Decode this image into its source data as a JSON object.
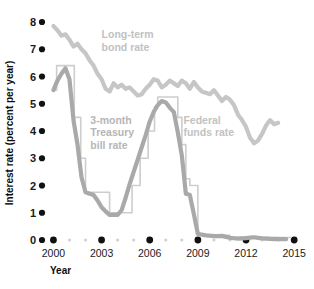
{
  "chart_data": {
    "type": "line",
    "title": "",
    "xlabel": "Year",
    "ylabel": "Interest rate (percent per year)",
    "xlim": [
      1999.6,
      2015.3
    ],
    "ylim": [
      0,
      8.4
    ],
    "grid": false,
    "legend_position": "inline-annotations",
    "x_ticks_major": [
      "2000",
      "2003",
      "2006",
      "2009",
      "2012",
      "2015"
    ],
    "x_ticks_major_values": [
      2000,
      2003,
      2006,
      2009,
      2012,
      2015
    ],
    "x_ticks_minor_values": [
      2001,
      2002,
      2004,
      2005,
      2007,
      2008,
      2010,
      2011,
      2013,
      2014
    ],
    "y_ticks": [
      "0",
      "1",
      "2",
      "3",
      "4",
      "5",
      "6",
      "7",
      "8"
    ],
    "y_tick_values": [
      0,
      1,
      2,
      3,
      4,
      5,
      6,
      7,
      8
    ],
    "series": [
      {
        "name": "Long-term bond rate",
        "color": "#c6c6c6",
        "label_color": "#c2c2c2",
        "style": "smooth-line",
        "label_x": 2003.0,
        "label_y": 7.25,
        "x": [
          2000.0,
          2000.25,
          2000.5,
          2000.75,
          2001.0,
          2001.25,
          2001.5,
          2001.75,
          2002.0,
          2002.25,
          2002.5,
          2002.75,
          2003.0,
          2003.25,
          2003.5,
          2003.75,
          2004.0,
          2004.25,
          2004.5,
          2004.75,
          2005.0,
          2005.25,
          2005.5,
          2005.75,
          2006.0,
          2006.25,
          2006.5,
          2006.75,
          2007.0,
          2007.25,
          2007.5,
          2007.75,
          2008.0,
          2008.25,
          2008.5,
          2008.75,
          2009.0,
          2009.25,
          2009.5,
          2009.75,
          2010.0,
          2010.25,
          2010.5,
          2010.75,
          2011.0,
          2011.25,
          2011.5,
          2011.75,
          2012.0,
          2012.25,
          2012.5,
          2012.75,
          2013.0,
          2013.25,
          2013.5,
          2013.75,
          2014.0
        ],
        "values": [
          7.85,
          7.7,
          7.5,
          7.55,
          7.35,
          7.1,
          7.2,
          7.0,
          6.85,
          6.6,
          6.4,
          6.1,
          5.9,
          5.55,
          5.45,
          5.75,
          5.6,
          5.7,
          5.55,
          5.6,
          5.45,
          5.3,
          5.35,
          5.55,
          5.7,
          5.9,
          5.85,
          5.6,
          5.7,
          5.85,
          5.75,
          5.65,
          5.85,
          5.75,
          5.55,
          5.8,
          5.6,
          5.45,
          5.4,
          5.35,
          5.5,
          5.3,
          5.1,
          5.25,
          5.15,
          4.95,
          4.6,
          4.4,
          4.15,
          3.75,
          3.55,
          3.65,
          3.9,
          4.2,
          4.4,
          4.25,
          4.3
        ]
      },
      {
        "name": "3-month Treasury bill rate",
        "color": "#a9a9a9",
        "label_color": "#b4b4b4",
        "style": "smooth-line",
        "label_x": 2002.3,
        "label_y": 4.0,
        "x": [
          2000.0,
          2000.25,
          2000.5,
          2000.75,
          2001.0,
          2001.25,
          2001.5,
          2001.75,
          2002.0,
          2002.25,
          2002.5,
          2002.75,
          2003.0,
          2003.25,
          2003.5,
          2003.75,
          2004.0,
          2004.25,
          2004.5,
          2004.75,
          2005.0,
          2005.25,
          2005.5,
          2005.75,
          2006.0,
          2006.25,
          2006.5,
          2006.75,
          2007.0,
          2007.25,
          2007.5,
          2007.75,
          2008.0,
          2008.25,
          2008.5,
          2008.75,
          2009.0,
          2009.5,
          2010.0,
          2010.5,
          2011.0,
          2011.5,
          2012.0,
          2012.5,
          2013.0,
          2013.5,
          2014.0,
          2014.5
        ],
        "values": [
          5.5,
          5.85,
          6.1,
          6.3,
          5.9,
          4.4,
          3.5,
          2.3,
          1.75,
          1.7,
          1.65,
          1.45,
          1.2,
          1.05,
          0.92,
          0.93,
          0.92,
          1.1,
          1.55,
          2.05,
          2.5,
          2.95,
          3.4,
          3.85,
          4.35,
          4.7,
          4.95,
          5.1,
          5.05,
          4.85,
          4.7,
          3.95,
          3.1,
          1.7,
          1.65,
          0.95,
          0.22,
          0.17,
          0.14,
          0.15,
          0.08,
          0.05,
          0.07,
          0.1,
          0.06,
          0.04,
          0.03,
          0.03
        ]
      },
      {
        "name": "Federal funds rate",
        "color": "#cdcdcd",
        "label_color": "#c2c2c2",
        "style": "step-outline",
        "label_x": 2008.1,
        "label_y": 4.05,
        "x": [
          2000.0,
          2000.2,
          2000.45,
          2001.0,
          2001.3,
          2001.7,
          2002.0,
          2002.9,
          2003.5,
          2004.4,
          2004.9,
          2005.4,
          2005.9,
          2006.3,
          2006.5,
          2007.5,
          2007.75,
          2008.0,
          2008.25,
          2008.5,
          2008.85,
          2009.0,
          2010.0,
          2011.0,
          2012.0,
          2013.0,
          2014.0,
          2014.8
        ],
        "values": [
          5.5,
          6.4,
          6.4,
          6.4,
          4.5,
          3.0,
          1.75,
          1.75,
          1.0,
          1.0,
          2.0,
          3.0,
          4.0,
          4.9,
          5.25,
          5.25,
          4.5,
          3.5,
          2.25,
          2.0,
          2.0,
          0.2,
          0.17,
          0.1,
          0.12,
          0.1,
          0.09,
          0.09
        ]
      }
    ],
    "annotations": [
      {
        "text": "Long-term",
        "x": 2003.0,
        "y": 7.4
      },
      {
        "text": "bond rate",
        "x": 2003.0,
        "y": 6.95
      },
      {
        "text": "3-month",
        "x": 2002.3,
        "y": 4.25
      },
      {
        "text": "Treasury",
        "x": 2002.3,
        "y": 3.8
      },
      {
        "text": "bill rate",
        "x": 2002.3,
        "y": 3.35
      },
      {
        "text": "Federal",
        "x": 2008.1,
        "y": 4.25
      },
      {
        "text": "funds rate",
        "x": 2008.1,
        "y": 3.8
      }
    ]
  },
  "axes": {
    "y_title": "Interest rate (percent per year)",
    "x_title": "Year",
    "y_labels": [
      "8",
      "7",
      "6",
      "5",
      "4",
      "3",
      "2",
      "1",
      "0"
    ],
    "x_labels": [
      "2000",
      "2003",
      "2006",
      "2009",
      "2012",
      "2015"
    ]
  },
  "legend_text": {
    "long_term_line1": "Long-term",
    "long_term_line2": "bond rate",
    "tbill_line1": "3-month",
    "tbill_line2": "Treasury",
    "tbill_line3": "bill rate",
    "ffr_line1": "Federal",
    "ffr_line2": "funds rate"
  }
}
